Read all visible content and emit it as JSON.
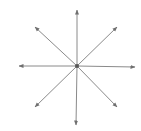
{
  "diagram": {
    "center": {
      "x": 77,
      "y": 66
    },
    "stroke_color": "#8a8a8a",
    "center_color": "#555555",
    "rays": [
      {
        "name": "up",
        "x": 77,
        "y": 10
      },
      {
        "name": "down",
        "x": 76,
        "y": 125
      },
      {
        "name": "left",
        "x": 19,
        "y": 66
      },
      {
        "name": "right",
        "x": 135,
        "y": 67
      },
      {
        "name": "up-left",
        "x": 35,
        "y": 27
      },
      {
        "name": "up-right",
        "x": 117,
        "y": 27
      },
      {
        "name": "down-left",
        "x": 35,
        "y": 107
      },
      {
        "name": "down-right",
        "x": 117,
        "y": 107
      }
    ],
    "cutoff_text": "· · ·"
  }
}
